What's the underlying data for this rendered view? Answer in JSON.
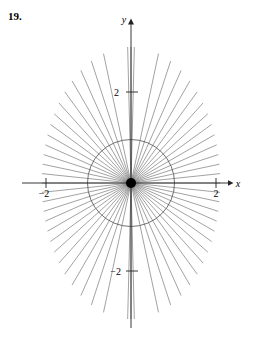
{
  "exercise": {
    "number": "19."
  },
  "chart_data": {
    "type": "line",
    "title": "",
    "subtitle": "",
    "xlabel": "x",
    "ylabel": "y",
    "plot_kind": "polar-rose-rays",
    "grid": false,
    "legend": false,
    "legend_position": "none",
    "xlim": [
      -2.6,
      2.6
    ],
    "ylim": [
      -3.4,
      3.4
    ],
    "xticks": [
      -2,
      2
    ],
    "yticks": [
      -2,
      2
    ],
    "xticklabels": [
      "−2",
      "2"
    ],
    "yticklabels": [
      "−2",
      "2"
    ],
    "axis_arrows": {
      "x_positive": true,
      "y_positive": true
    },
    "origin_marker": {
      "present": true,
      "shape": "filled-dot",
      "radius_px": 5,
      "color": "#000000"
    },
    "circle": {
      "center": [
        0,
        0
      ],
      "radius": 1.0,
      "stroke": "#4d4d4d",
      "fill": "none"
    },
    "rays": {
      "count": 60,
      "from_origin": true,
      "angle_start_deg": 0,
      "angle_step_deg": 6,
      "envelope": "ellipse",
      "envelope_semi_x": 2.1,
      "envelope_semi_y": 3.2,
      "stroke": "#555555",
      "stroke_width_px": 0.55
    },
    "vertical_band": {
      "present": true,
      "description": "near-vertical rays cluster into a narrow band straddling the y-axis",
      "half_width": 0.12,
      "y_extent": [
        -3.2,
        3.2
      ]
    },
    "colors": {
      "axis": "#222222",
      "ray": "#555555",
      "circle": "#4d4d4d",
      "text": "#000000",
      "background": "#ffffff"
    }
  }
}
